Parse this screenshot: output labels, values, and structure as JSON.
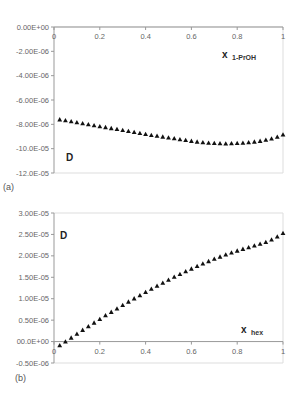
{
  "chart_data": [
    {
      "type": "scatter",
      "panel_label": "(a)",
      "title": "",
      "xlabel": "x",
      "xlabel_sub": "1-PrOH",
      "ylabel": "D",
      "xlim": [
        0,
        1
      ],
      "ylim": [
        -1.2e-05,
        0
      ],
      "x_ticks": [
        "0",
        "0.2",
        "0.4",
        "0.6",
        "0.8",
        "1"
      ],
      "y_ticks": [
        "0.00E+00",
        "-2.00E-06",
        "-4.00E-06",
        "-6.00E-06",
        "-8.00E-06",
        "-10.0E-05",
        "-12.0E-05"
      ],
      "x_axis_position": "top",
      "marker": "triangle",
      "series": [
        {
          "name": "D",
          "x": [
            0.025,
            0.05,
            0.075,
            0.1,
            0.125,
            0.15,
            0.175,
            0.2,
            0.225,
            0.25,
            0.275,
            0.3,
            0.325,
            0.35,
            0.375,
            0.4,
            0.425,
            0.45,
            0.475,
            0.5,
            0.525,
            0.55,
            0.575,
            0.6,
            0.625,
            0.65,
            0.675,
            0.7,
            0.725,
            0.75,
            0.775,
            0.8,
            0.825,
            0.85,
            0.875,
            0.9,
            0.925,
            0.95,
            0.975,
            1.0
          ],
          "values": [
            -7.6e-06,
            -7.68e-06,
            -7.76e-06,
            -7.84e-06,
            -7.92e-06,
            -8e-06,
            -8.08e-06,
            -8.16e-06,
            -8.24e-06,
            -8.32e-06,
            -8.4e-06,
            -8.48e-06,
            -8.56e-06,
            -8.64e-06,
            -8.72e-06,
            -8.8e-06,
            -8.88e-06,
            -8.95e-06,
            -9.02e-06,
            -9.09e-06,
            -9.16e-06,
            -9.23e-06,
            -9.3e-06,
            -9.37e-06,
            -9.43e-06,
            -9.48e-06,
            -9.52e-06,
            -9.55e-06,
            -9.57e-06,
            -9.58e-06,
            -9.57e-06,
            -9.55e-06,
            -9.52e-06,
            -9.48e-06,
            -9.43e-06,
            -9.37e-06,
            -9.28e-06,
            -9.17e-06,
            -9.03e-06,
            -8.85e-06
          ]
        }
      ]
    },
    {
      "type": "scatter",
      "panel_label": "(b)",
      "title": "",
      "xlabel": "x",
      "xlabel_sub": "hex",
      "ylabel": "D",
      "xlim": [
        0,
        1
      ],
      "ylim": [
        -5e-06,
        3e-05
      ],
      "x_ticks": [
        "0",
        "0.2",
        "0.4",
        "0.6",
        "0.8",
        "1"
      ],
      "y_ticks": [
        "3.00E-05",
        "2.50E-05",
        "2.00E-05",
        "1.50E-05",
        "1.00E-05",
        "0.50E-06",
        "00.0E+00",
        "-0.50E-06"
      ],
      "x_axis_position": "y=0",
      "marker": "triangle",
      "series": [
        {
          "name": "D",
          "x": [
            0.025,
            0.05,
            0.075,
            0.1,
            0.125,
            0.15,
            0.175,
            0.2,
            0.225,
            0.25,
            0.275,
            0.3,
            0.325,
            0.35,
            0.375,
            0.4,
            0.425,
            0.45,
            0.475,
            0.5,
            0.525,
            0.55,
            0.575,
            0.6,
            0.625,
            0.65,
            0.675,
            0.7,
            0.725,
            0.75,
            0.775,
            0.8,
            0.825,
            0.85,
            0.875,
            0.9,
            0.925,
            0.95,
            0.975,
            1.0
          ],
          "values": [
            -9e-07,
            0.0,
            9e-07,
            1.8e-06,
            2.7e-06,
            3.55e-06,
            4.4e-06,
            5.25e-06,
            6.1e-06,
            6.9e-06,
            7.7e-06,
            8.5e-06,
            9.3e-06,
            1.005e-05,
            1.08e-05,
            1.155e-05,
            1.23e-05,
            1.3e-05,
            1.37e-05,
            1.44e-05,
            1.51e-05,
            1.575e-05,
            1.64e-05,
            1.7e-05,
            1.76e-05,
            1.82e-05,
            1.875e-05,
            1.93e-05,
            1.98e-05,
            2.03e-05,
            2.075e-05,
            2.12e-05,
            2.16e-05,
            2.2e-05,
            2.24e-05,
            2.28e-05,
            2.32e-05,
            2.38e-05,
            2.45e-05,
            2.53e-05
          ]
        }
      ]
    }
  ]
}
